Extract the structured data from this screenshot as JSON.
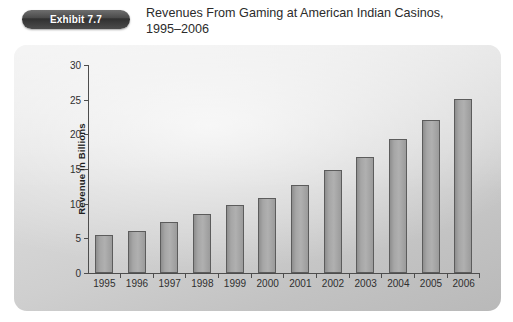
{
  "header": {
    "badge_label": "Exhibit 7.7",
    "title_line1": "Revenues From Gaming at American Indian Casinos,",
    "title_line2": "1995–2006"
  },
  "chart_data": {
    "type": "bar",
    "title": "Revenues From Gaming at American Indian Casinos, 1995–2006",
    "xlabel": "",
    "ylabel": "Revenue in Billions",
    "ylim": [
      0,
      30
    ],
    "yticks": [
      0,
      5,
      10,
      15,
      20,
      25,
      30
    ],
    "ytick_labels": [
      "0",
      "5",
      "10",
      "15",
      "20",
      "25",
      "30"
    ],
    "grid": false,
    "legend": null,
    "categories": [
      "1995",
      "1996",
      "1997",
      "1998",
      "1999",
      "2000",
      "2001",
      "2002",
      "2003",
      "2004",
      "2005",
      "2006"
    ],
    "values": [
      5.5,
      6.1,
      7.4,
      8.5,
      9.8,
      10.8,
      12.7,
      14.8,
      16.8,
      19.4,
      22.0,
      25.1
    ],
    "bar_color": "#a6a6a6",
    "bar_border_color": "#5c5c5c",
    "panel_background": "#d2d2d2",
    "axis_color": "#4d4d4d",
    "text_color": "#2f2f2f"
  }
}
